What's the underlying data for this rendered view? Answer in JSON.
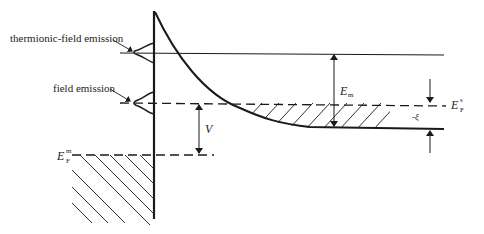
{
  "figure": {
    "type": "energy-band-diagram"
  },
  "labels": {
    "thermionic_field_emission": "thermionic-field emission",
    "field_emission": "field emission",
    "E_m_main": "E",
    "E_m_sub": "m",
    "E_Fs_main": "E",
    "E_Fs_sup": "s",
    "E_Fs_sub": "F",
    "E_Fm_main": "E",
    "E_Fm_sup": "m",
    "E_Fm_sub": "F",
    "V": "V",
    "xi": "-ξ"
  },
  "colors": {
    "line": "#1a1a1a",
    "background": "#ffffff"
  }
}
